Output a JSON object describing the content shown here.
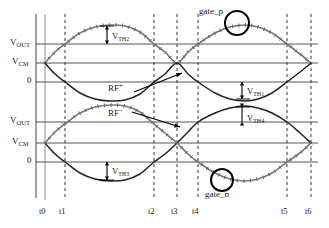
{
  "figure": {
    "type": "waveform-timing-diagram",
    "background": "#ffffff",
    "curve_color_marked": "#777777",
    "curve_color_plain": "#222222",
    "gridline_color": "#555555",
    "axis_color": "#444444"
  },
  "axes": {
    "upper": {
      "y_labels": [
        {
          "id": "vout",
          "text": "V",
          "sub": "OUT"
        },
        {
          "id": "vcm",
          "text": "V",
          "sub": "CM"
        },
        {
          "id": "zero",
          "text": "0",
          "sub": ""
        }
      ]
    },
    "lower": {
      "y_labels": [
        {
          "id": "vout",
          "text": "V",
          "sub": "OUT"
        },
        {
          "id": "vcm",
          "text": "V",
          "sub": "CM"
        },
        {
          "id": "zero",
          "text": "0",
          "sub": ""
        }
      ]
    },
    "x_ticks": [
      "t0",
      "t1",
      "t2",
      "t3",
      "t4",
      "t5",
      "t6"
    ]
  },
  "annotations": {
    "vth2": {
      "text": "V",
      "sub": "TH2"
    },
    "vth1": {
      "text": "V",
      "sub": "TH1"
    },
    "vth4": {
      "text": "V",
      "sub": "TH4"
    },
    "vth3": {
      "text": "V",
      "sub": "TH3"
    },
    "rf_plus": {
      "text": "RF",
      "sup": "+"
    },
    "rf_minus": {
      "text": "RF",
      "sup": "−"
    },
    "gate_p": "gate_p",
    "gate_n": "gate_n"
  },
  "chart_data": {
    "type": "line",
    "title": "",
    "xlabel": "",
    "ylabel": "",
    "x_tick_labels": [
      "t0",
      "t1",
      "t2",
      "t3",
      "t4",
      "t5",
      "t6"
    ],
    "x_tick_positions": [
      45,
      65,
      154,
      177,
      198,
      287,
      311
    ],
    "upper_panel": {
      "gridlines": [
        {
          "label": "VOUT",
          "y": 44
        },
        {
          "label": "VCM",
          "y": 63
        },
        {
          "label": "0",
          "y": 82
        }
      ],
      "series": [
        {
          "name": "gate_p",
          "style": "gray-marked",
          "points": [
            [
              45,
              63
            ],
            [
              55,
              52
            ],
            [
              65,
              44
            ],
            [
              80,
              33
            ],
            [
              95,
              27
            ],
            [
              110,
              25
            ],
            [
              125,
              26
            ],
            [
              140,
              32
            ],
            [
              154,
              44
            ],
            [
              165,
              52
            ],
            [
              177,
              63
            ],
            [
              188,
              52
            ],
            [
              198,
              44
            ],
            [
              215,
              33
            ],
            [
              230,
              27
            ],
            [
              245,
              25
            ],
            [
              258,
              27
            ],
            [
              272,
              33
            ],
            [
              287,
              44
            ],
            [
              300,
              54
            ],
            [
              311,
              63
            ]
          ]
        },
        {
          "name": "RF+",
          "style": "black-plain",
          "points": [
            [
              45,
              63
            ],
            [
              55,
              74
            ],
            [
              65,
              82
            ],
            [
              80,
              93
            ],
            [
              95,
              99
            ],
            [
              110,
              101
            ],
            [
              125,
              100
            ],
            [
              140,
              94
            ],
            [
              154,
              82
            ],
            [
              165,
              74
            ],
            [
              177,
              63
            ],
            [
              188,
              74
            ],
            [
              198,
              82
            ],
            [
              215,
              93
            ],
            [
              230,
              99
            ],
            [
              245,
              101
            ],
            [
              258,
              99
            ],
            [
              272,
              93
            ],
            [
              287,
              82
            ],
            [
              300,
              72
            ],
            [
              311,
              63
            ]
          ]
        }
      ]
    },
    "lower_panel": {
      "gridlines": [
        {
          "label": "VOUT",
          "y": 122
        },
        {
          "label": "VCM",
          "y": 143
        },
        {
          "label": "0",
          "y": 162
        }
      ],
      "series": [
        {
          "name": "RF-",
          "style": "black-plain",
          "points": [
            [
              45,
              143
            ],
            [
              55,
              154
            ],
            [
              65,
              162
            ],
            [
              80,
              173
            ],
            [
              95,
              179
            ],
            [
              110,
              181
            ],
            [
              125,
              180
            ],
            [
              140,
              174
            ],
            [
              154,
              162
            ],
            [
              165,
              154
            ],
            [
              177,
              143
            ],
            [
              188,
              132
            ],
            [
              198,
              122
            ],
            [
              215,
              113
            ],
            [
              230,
              108
            ],
            [
              245,
              106
            ],
            [
              258,
              108
            ],
            [
              272,
              113
            ],
            [
              287,
              122
            ],
            [
              300,
              133
            ],
            [
              311,
              143
            ]
          ]
        },
        {
          "name": "gate_n",
          "style": "gray-marked",
          "points": [
            [
              45,
              143
            ],
            [
              55,
              132
            ],
            [
              65,
              124
            ],
            [
              80,
              113
            ],
            [
              95,
              107
            ],
            [
              110,
              105
            ],
            [
              125,
              106
            ],
            [
              140,
              112
            ],
            [
              154,
              124
            ],
            [
              165,
              133
            ],
            [
              177,
              143
            ],
            [
              188,
              154
            ],
            [
              198,
              162
            ],
            [
              215,
              173
            ],
            [
              230,
              179
            ],
            [
              245,
              181
            ],
            [
              258,
              179
            ],
            [
              272,
              173
            ],
            [
              287,
              162
            ],
            [
              300,
              153
            ],
            [
              311,
              143
            ]
          ]
        }
      ]
    },
    "markers": [
      {
        "name": "gate_p-circle",
        "cx": 237,
        "cy": 23,
        "rx": 12,
        "ry": 12
      },
      {
        "name": "gate_n-circle",
        "cx": 222,
        "cy": 180,
        "rx": 11,
        "ry": 11
      }
    ]
  }
}
